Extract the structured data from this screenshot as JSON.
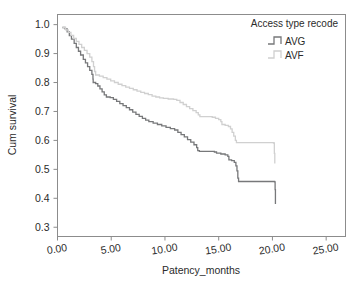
{
  "chart_data": {
    "type": "line",
    "subtype": "kaplan-meier-step",
    "title": "",
    "xlabel": "Patency_months",
    "ylabel": "Cum survival",
    "xlim": [
      0,
      26.8
    ],
    "ylim": [
      0.268,
      1.035
    ],
    "xticks": [
      0,
      5,
      10,
      15,
      20,
      25
    ],
    "xtick_labels": [
      "0.00",
      "5.00",
      "10.00",
      "15.00",
      "20.00",
      "25.00"
    ],
    "yticks": [
      0.3,
      0.4,
      0.5,
      0.6,
      0.7,
      0.8,
      0.9,
      1.0
    ],
    "ytick_labels": [
      "0.3",
      "0.4",
      "0.5",
      "0.6",
      "0.7",
      "0.8",
      "0.9",
      "1.0"
    ],
    "grid": false,
    "legend_position": "top-right",
    "legend_title": "Access type recode",
    "series": [
      {
        "name": "AVG",
        "color": "#77787a",
        "points": [
          [
            0.45,
            0.99
          ],
          [
            0.7,
            0.985
          ],
          [
            0.9,
            0.975
          ],
          [
            1.1,
            0.962
          ],
          [
            1.3,
            0.95
          ],
          [
            1.55,
            0.935
          ],
          [
            1.75,
            0.921
          ],
          [
            1.95,
            0.908
          ],
          [
            2.15,
            0.895
          ],
          [
            2.4,
            0.88
          ],
          [
            2.6,
            0.868
          ],
          [
            2.8,
            0.855
          ],
          [
            3.0,
            0.842
          ],
          [
            3.2,
            0.828
          ],
          [
            3.3,
            0.812
          ],
          [
            3.32,
            0.8
          ],
          [
            3.55,
            0.796
          ],
          [
            3.75,
            0.788
          ],
          [
            3.95,
            0.778
          ],
          [
            4.15,
            0.768
          ],
          [
            4.35,
            0.757
          ],
          [
            4.55,
            0.75
          ],
          [
            4.9,
            0.748
          ],
          [
            5.2,
            0.742
          ],
          [
            5.5,
            0.735
          ],
          [
            5.8,
            0.727
          ],
          [
            6.1,
            0.72
          ],
          [
            6.4,
            0.713
          ],
          [
            6.7,
            0.706
          ],
          [
            7.0,
            0.698
          ],
          [
            7.3,
            0.69
          ],
          [
            7.6,
            0.683
          ],
          [
            7.9,
            0.676
          ],
          [
            8.2,
            0.67
          ],
          [
            8.5,
            0.665
          ],
          [
            8.9,
            0.66
          ],
          [
            9.3,
            0.655
          ],
          [
            9.7,
            0.65
          ],
          [
            10.1,
            0.645
          ],
          [
            10.5,
            0.641
          ],
          [
            10.9,
            0.636
          ],
          [
            11.2,
            0.628
          ],
          [
            11.5,
            0.62
          ],
          [
            11.8,
            0.612
          ],
          [
            12.1,
            0.603
          ],
          [
            12.4,
            0.594
          ],
          [
            12.7,
            0.585
          ],
          [
            12.95,
            0.575
          ],
          [
            13.05,
            0.565
          ],
          [
            13.2,
            0.562
          ],
          [
            14.6,
            0.56
          ],
          [
            14.8,
            0.556
          ],
          [
            15.2,
            0.553
          ],
          [
            15.6,
            0.55
          ],
          [
            15.85,
            0.545
          ],
          [
            15.95,
            0.533
          ],
          [
            16.2,
            0.53
          ],
          [
            16.45,
            0.524
          ],
          [
            16.6,
            0.512
          ],
          [
            16.7,
            0.495
          ],
          [
            16.78,
            0.47
          ],
          [
            16.85,
            0.458
          ],
          [
            20.2,
            0.457
          ],
          [
            20.25,
            0.43
          ],
          [
            20.28,
            0.38
          ]
        ]
      },
      {
        "name": "AVF",
        "color": "#d0d0d0",
        "points": [
          [
            0.45,
            0.99
          ],
          [
            0.75,
            0.982
          ],
          [
            1.0,
            0.973
          ],
          [
            1.25,
            0.963
          ],
          [
            1.5,
            0.952
          ],
          [
            1.75,
            0.942
          ],
          [
            2.0,
            0.932
          ],
          [
            2.25,
            0.921
          ],
          [
            2.5,
            0.911
          ],
          [
            2.75,
            0.9
          ],
          [
            3.0,
            0.888
          ],
          [
            3.2,
            0.872
          ],
          [
            3.35,
            0.855
          ],
          [
            3.45,
            0.838
          ],
          [
            3.55,
            0.826
          ],
          [
            3.9,
            0.822
          ],
          [
            4.25,
            0.817
          ],
          [
            4.6,
            0.812
          ],
          [
            4.95,
            0.806
          ],
          [
            5.3,
            0.8
          ],
          [
            5.65,
            0.794
          ],
          [
            6.0,
            0.789
          ],
          [
            6.35,
            0.784
          ],
          [
            6.7,
            0.78
          ],
          [
            7.05,
            0.775
          ],
          [
            7.4,
            0.77
          ],
          [
            7.75,
            0.766
          ],
          [
            8.1,
            0.762
          ],
          [
            8.45,
            0.758
          ],
          [
            8.8,
            0.753
          ],
          [
            9.15,
            0.75
          ],
          [
            9.5,
            0.747
          ],
          [
            9.85,
            0.745
          ],
          [
            10.3,
            0.743
          ],
          [
            10.8,
            0.742
          ],
          [
            11.1,
            0.738
          ],
          [
            11.4,
            0.731
          ],
          [
            11.7,
            0.724
          ],
          [
            12.0,
            0.717
          ],
          [
            12.3,
            0.71
          ],
          [
            12.6,
            0.703
          ],
          [
            12.9,
            0.696
          ],
          [
            13.1,
            0.688
          ],
          [
            13.25,
            0.682
          ],
          [
            14.4,
            0.68
          ],
          [
            14.7,
            0.676
          ],
          [
            15.0,
            0.672
          ],
          [
            15.2,
            0.665
          ],
          [
            15.3,
            0.655
          ],
          [
            15.6,
            0.652
          ],
          [
            15.9,
            0.648
          ],
          [
            16.1,
            0.64
          ],
          [
            16.25,
            0.628
          ],
          [
            16.4,
            0.615
          ],
          [
            16.55,
            0.6
          ],
          [
            16.65,
            0.592
          ],
          [
            20.1,
            0.591
          ],
          [
            20.18,
            0.555
          ],
          [
            20.22,
            0.52
          ]
        ]
      }
    ]
  },
  "legend": {
    "title": "Access type recode",
    "items": [
      {
        "label": "AVG",
        "color": "#77787a"
      },
      {
        "label": "AVF",
        "color": "#d0d0d0"
      }
    ]
  },
  "axes": {
    "x_title": "Patency_months",
    "y_title": "Cum survival"
  }
}
